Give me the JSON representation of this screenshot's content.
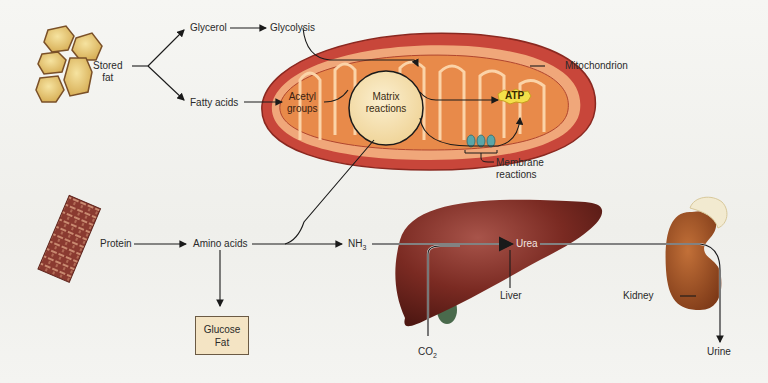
{
  "diagram": {
    "sources": {
      "stored_fat": "Stored\nfat",
      "stored_fat_line1": "Stored",
      "stored_fat_line2": "fat",
      "protein": "Protein"
    },
    "fat_pathway": {
      "glycerol": "Glycerol",
      "glycolysis": "Glycolysis",
      "fatty_acids": "Fatty acids",
      "acetyl_line1": "Acetyl",
      "acetyl_line2": "groups"
    },
    "mitochondrion": {
      "label": "Mitochondrion",
      "matrix_line1": "Matrix",
      "matrix_line2": "reactions",
      "atp": "ATP",
      "membrane_line1": "Membrane",
      "membrane_line2": "reactions"
    },
    "protein_pathway": {
      "amino_acids": "Amino acids",
      "glucose": "Glucose",
      "fat": "Fat",
      "nh3": "NH",
      "nh3_sub": "3",
      "urea": "Urea",
      "co2": "CO",
      "co2_sub": "2",
      "liver": "Liver",
      "kidney": "Kidney",
      "urine": "Urine"
    },
    "colors": {
      "arrow": "#1a1a1a",
      "mito_outer": "#c8463a",
      "mito_inner": "#e88a4a",
      "matrix_circle": "#f6dfae",
      "liver": "#7a2a22",
      "kidney": "#9a4e22",
      "fat_cells": "#e8c870",
      "glucose_box": "#f4e4c4"
    }
  }
}
